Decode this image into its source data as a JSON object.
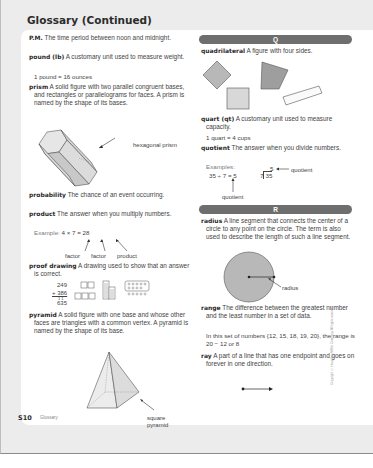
{
  "page": {
    "title": "Glossary (Continued)",
    "footer_page": "S10",
    "footer_label": "Glossary",
    "copyright": "Copyright © Houghton Mifflin Company. All rights reserved."
  },
  "left_column": {
    "entries": [
      {
        "term": "P.M.",
        "definition": "The time period between noon and midnight."
      },
      {
        "term": "pound (lb)",
        "definition": "A customary unit used to measure weight.",
        "example": "1 pound = 16 ounces"
      },
      {
        "term": "prism",
        "definition": "A solid figure with two parallel congruent bases, and rectangles or parallelograms for faces. A prism is named by the shape of its bases.",
        "figure_label": "hexagonal prism"
      },
      {
        "term": "probability",
        "definition": "The chance of an event occurring."
      },
      {
        "term": "product",
        "definition": "The answer when you multiply numbers.",
        "example_label": "Example:",
        "example": "4 × 7 = 28",
        "arrow_labels": [
          "factor",
          "factor",
          "product"
        ]
      },
      {
        "term": "proof drawing",
        "definition": "A drawing used to show that an answer is correct.",
        "addition": {
          "addend1": "249",
          "addend2": "+ 386",
          "carry": "1 1",
          "sum": "635"
        }
      },
      {
        "term": "pyramid",
        "definition": "A solid figure with one base and whose other faces are triangles with a common vertex. A pyramid is named by the shape of its base.",
        "figure_label_line1": "square",
        "figure_label_line2": "pyramid"
      }
    ]
  },
  "right_column": {
    "sections": [
      {
        "letter": "Q"
      },
      {
        "letter": "R"
      }
    ],
    "entries": [
      {
        "term": "quadrilateral",
        "definition": "A figure with four sides."
      },
      {
        "term": "quart (qt)",
        "definition": "A customary unit used to measure capacity.",
        "example": "1 quart = 4 cups"
      },
      {
        "term": "quotient",
        "definition": "The answer when you divide numbers.",
        "example_label": "Examples:",
        "example1": "35 ÷ 7 = 5",
        "example2_quotient": "5",
        "example2_divisor": "7",
        "example2_dividend": "35",
        "arrow_label_side": "quotient",
        "arrow_label_below": "quotient"
      },
      {
        "term": "radius",
        "definition": "A line segment that connects the center of a circle to any point on the circle. The term is also used to describe the length of such a line segment.",
        "figure_label": "radius"
      },
      {
        "term": "range",
        "definition": "The difference between the greatest number and the least number in a set of data.",
        "example": "In this set of numbers {12, 15, 18, 19, 20}, the range is 20 − 12 or 8"
      },
      {
        "term": "ray",
        "definition": "A part of a line that has one endpoint and goes on forever in one direction."
      }
    ]
  },
  "colors": {
    "page_bg": "#ececec",
    "card_bg": "#ffffff",
    "letter_bar": "#6e6e6e",
    "shape_fill": "#b8b8b8",
    "shape_stroke": "#555555"
  }
}
